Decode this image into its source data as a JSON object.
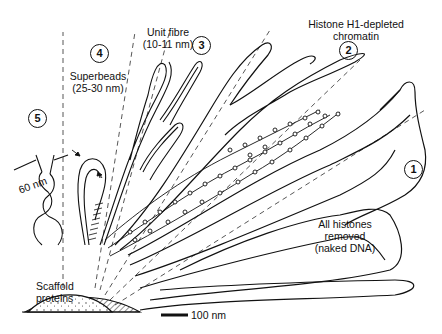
{
  "diagram": {
    "type": "chromatin structure levels radiating from scaffold",
    "stages": [
      {
        "number": "1",
        "label_line1": "All histones",
        "label_line2": "removed",
        "label_line3": "(naked DNA)"
      },
      {
        "number": "2",
        "label_line1": "Histone H1-depleted",
        "label_line2": "chromatin"
      },
      {
        "number": "3",
        "label_line1": "Unit fibre",
        "label_line2": "(10-11 nm)"
      },
      {
        "number": "4",
        "label_line1": "Superbeads",
        "label_line2": "(25-30 nm)"
      },
      {
        "number": "5"
      }
    ],
    "scaffold_label_line1": "Scaffold",
    "scaffold_label_line2": "proteins",
    "dimension_label": "60 nm",
    "scale_bar_label": "100 nm"
  }
}
